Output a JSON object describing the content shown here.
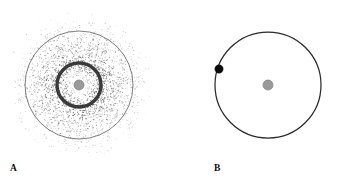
{
  "figure": {
    "width": 343,
    "height": 182,
    "background_color": "#ffffff",
    "type": "two-panel-schematic"
  },
  "panels": [
    {
      "id": "A",
      "label": "A",
      "label_x": 13,
      "label_y": 170,
      "center_x": 79,
      "center_y": 85,
      "elements": {
        "outer_circle": {
          "name": "outer-boundary-circle",
          "radius": 54,
          "stroke_color": "#6e6e6e",
          "stroke_width": 0.9,
          "fill": "none"
        },
        "inner_ring": {
          "name": "dense-inner-ring",
          "radius": 22,
          "stroke_color": "#3a3a3a",
          "stroke_width": 3.4,
          "fill": "none"
        },
        "central_body": {
          "name": "central-gray-body",
          "radius": 5,
          "fill_color": "#9a9a9a",
          "stroke_color": "#7d7d7d"
        },
        "stipple_cloud": {
          "name": "particle-stipple-cloud",
          "dot_color": "#5a5a5a",
          "max_radius": 74,
          "peak_density_radius": 24,
          "point_count": 2600,
          "dot_radius_px": 0.42
        }
      }
    },
    {
      "id": "B",
      "label": "B",
      "label_x": 217,
      "label_y": 170,
      "center_x": 268,
      "center_y": 85,
      "elements": {
        "orbit_circle": {
          "name": "orbit-circle",
          "radius": 53,
          "stroke_color": "#2b2b2b",
          "stroke_width": 1.25,
          "fill": "none"
        },
        "orbiting_particle": {
          "name": "orbiting-particle-dot",
          "radius": 4.2,
          "fill_color": "#0a0a0a",
          "angle_degrees": 152,
          "x": 219,
          "y": 69
        },
        "central_body": {
          "name": "central-gray-body",
          "radius": 5,
          "fill_color": "#9a9a9a",
          "stroke_color": "#7d7d7d"
        }
      }
    }
  ],
  "chart_data": {
    "type": "scatter",
    "title": "",
    "xlabel": "",
    "ylabel": "",
    "legend": [],
    "grid": false,
    "panels": [
      {
        "label": "A",
        "caption": "Stippled radial particle distribution with dense narrow ring and central body",
        "center": [
          79,
          85
        ],
        "radial_profile": {
          "r_values": [
            0,
            5,
            10,
            15,
            20,
            22,
            25,
            30,
            35,
            40,
            45,
            50,
            54,
            60,
            66,
            72,
            78
          ],
          "relative_density": [
            0.05,
            0.18,
            0.42,
            0.7,
            0.95,
            1.0,
            0.88,
            0.72,
            0.6,
            0.5,
            0.4,
            0.3,
            0.24,
            0.14,
            0.07,
            0.03,
            0.0
          ]
        },
        "markers": [
          {
            "name": "central-body",
            "r": 0,
            "size": 5,
            "color": "#9a9a9a"
          },
          {
            "name": "inner-ring",
            "r": 22,
            "width": 3.4,
            "color": "#3a3a3a"
          },
          {
            "name": "outer-circle",
            "r": 54,
            "width": 0.9,
            "color": "#6e6e6e"
          }
        ]
      },
      {
        "label": "B",
        "caption": "Single circular orbit with one point mass and central body",
        "center": [
          268,
          85
        ],
        "markers": [
          {
            "name": "central-body",
            "r": 0,
            "size": 5,
            "color": "#9a9a9a"
          },
          {
            "name": "orbit-circle",
            "r": 53,
            "width": 1.25,
            "color": "#2b2b2b"
          },
          {
            "name": "orbiting-particle",
            "r": 53,
            "angle_deg": 152,
            "size": 4.2,
            "color": "#0a0a0a"
          }
        ]
      }
    ]
  }
}
